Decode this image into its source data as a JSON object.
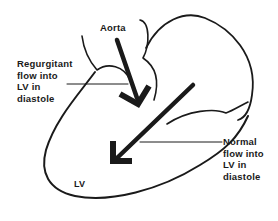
{
  "diagram": {
    "labels": {
      "aorta": "Aorta",
      "regurgitant": [
        "Regurgitant",
        "flow into",
        "LV in",
        "diastole"
      ],
      "normal": [
        "Normal",
        "flow into",
        "LV in",
        "diastole"
      ],
      "lv": "LV"
    },
    "colors": {
      "ink": "#1a1a1a",
      "background": "#ffffff"
    }
  }
}
